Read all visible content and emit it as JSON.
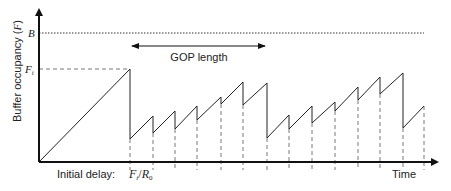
{
  "diagram": {
    "y_axis_label": "Buffer occupancy (F)",
    "y_axis_label_parts": {
      "prefix": "Buffer occupancy (",
      "symbol": "F",
      "suffix": ")"
    },
    "x_axis_label": "Time",
    "level_B_label": "B",
    "level_Fi_label": "F",
    "level_Fi_sub": "i",
    "gop_label": "GOP length",
    "initial_delay_label": "Initial delay:",
    "initial_delay_formula": {
      "num": "F",
      "num_sub": "i",
      "den": "R",
      "den_sub": "0"
    },
    "colors": {
      "line": "#222222",
      "dashed": "#555555"
    }
  },
  "chart_data": {
    "type": "line",
    "title": "",
    "xlabel": "Time",
    "ylabel": "Buffer occupancy (F)",
    "annotations": [
      "B",
      "F_i",
      "GOP length",
      "Initial delay: F_i/R_0"
    ],
    "levels": {
      "B": 33,
      "F_i": 70
    },
    "series": [
      {
        "name": "buffer occupancy (sawtooth, pixel coords)",
        "points": [
          [
            39,
            162
          ],
          [
            130,
            69
          ],
          [
            130,
            139
          ],
          [
            153,
            116
          ],
          [
            153,
            133
          ],
          [
            175,
            111
          ],
          [
            175,
            129
          ],
          [
            197,
            106
          ],
          [
            197,
            120
          ],
          [
            221,
            97
          ],
          [
            221,
            104
          ],
          [
            243,
            82
          ],
          [
            243,
            105
          ],
          [
            267,
            83
          ],
          [
            267,
            138
          ],
          [
            289,
            115
          ],
          [
            289,
            129
          ],
          [
            312,
            106
          ],
          [
            312,
            123
          ],
          [
            335,
            102
          ],
          [
            335,
            111
          ],
          [
            358,
            87
          ],
          [
            358,
            100
          ],
          [
            380,
            77
          ],
          [
            380,
            94
          ],
          [
            403,
            73
          ],
          [
            403,
            128
          ],
          [
            424,
            106
          ]
        ]
      }
    ],
    "frame_drop_times_px": [
      130,
      153,
      175,
      197,
      221,
      243,
      267,
      289,
      312,
      335,
      358,
      380,
      403,
      424
    ],
    "gop_span_px": [
      130,
      267
    ]
  }
}
